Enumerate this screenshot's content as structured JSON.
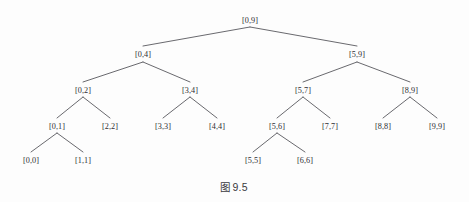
{
  "figure": {
    "caption_prefix": "图",
    "caption_number": "9.5",
    "caption_full": "图 9.5",
    "background_color": "#fdfdfd",
    "line_color": "#58585e",
    "text_color": "#2e2e33"
  },
  "chart_data": {
    "type": "diagram",
    "subtype": "segment-tree",
    "root": "[0,9]",
    "depth": 5,
    "node_count": 19,
    "levels": [
      {
        "level": 0,
        "y": 20,
        "labels": [
          "[0,9]"
        ]
      },
      {
        "level": 1,
        "y": 54,
        "labels": [
          "[0,4]",
          "[5,9]"
        ]
      },
      {
        "level": 2,
        "y": 90,
        "labels": [
          "[0,2]",
          "[3,4]",
          "[5,7]",
          "[8,9]"
        ]
      },
      {
        "level": 3,
        "y": 126,
        "labels": [
          "[0,1]",
          "[2,2]",
          "[3,3]",
          "[4,4]",
          "[5,6]",
          "[7,7]",
          "[8,8]",
          "[9,9]"
        ]
      },
      {
        "level": 4,
        "y": 160,
        "labels": [
          "[0,0]",
          "[1,1]",
          "[5,5]",
          "[6,6]"
        ]
      }
    ],
    "nodes": [
      {
        "id": "n0",
        "label": "[0,9]",
        "x": 250,
        "y": 20,
        "level": 0,
        "parent": null
      },
      {
        "id": "n1",
        "label": "[0,4]",
        "x": 143,
        "y": 54,
        "level": 1,
        "parent": "n0"
      },
      {
        "id": "n2",
        "label": "[5,9]",
        "x": 357,
        "y": 54,
        "level": 1,
        "parent": "n0"
      },
      {
        "id": "n3",
        "label": "[0,2]",
        "x": 83,
        "y": 90,
        "level": 2,
        "parent": "n1"
      },
      {
        "id": "n4",
        "label": "[3,4]",
        "x": 190,
        "y": 90,
        "level": 2,
        "parent": "n1"
      },
      {
        "id": "n5",
        "label": "[5,7]",
        "x": 303,
        "y": 90,
        "level": 2,
        "parent": "n2"
      },
      {
        "id": "n6",
        "label": "[8,9]",
        "x": 410,
        "y": 90,
        "level": 2,
        "parent": "n2"
      },
      {
        "id": "n7",
        "label": "[0,1]",
        "x": 57,
        "y": 126,
        "level": 3,
        "parent": "n3"
      },
      {
        "id": "n8",
        "label": "[2,2]",
        "x": 110,
        "y": 126,
        "level": 3,
        "parent": "n3"
      },
      {
        "id": "n9",
        "label": "[3,3]",
        "x": 163,
        "y": 126,
        "level": 3,
        "parent": "n4"
      },
      {
        "id": "n10",
        "label": "[4,4]",
        "x": 217,
        "y": 126,
        "level": 3,
        "parent": "n4"
      },
      {
        "id": "n11",
        "label": "[5,6]",
        "x": 277,
        "y": 126,
        "level": 3,
        "parent": "n5"
      },
      {
        "id": "n12",
        "label": "[7,7]",
        "x": 330,
        "y": 126,
        "level": 3,
        "parent": "n5"
      },
      {
        "id": "n13",
        "label": "[8,8]",
        "x": 383,
        "y": 126,
        "level": 3,
        "parent": "n6"
      },
      {
        "id": "n14",
        "label": "[9,9]",
        "x": 437,
        "y": 126,
        "level": 3,
        "parent": "n6"
      },
      {
        "id": "n15",
        "label": "[0,0]",
        "x": 31,
        "y": 160,
        "level": 4,
        "parent": "n7"
      },
      {
        "id": "n16",
        "label": "[1,1]",
        "x": 83,
        "y": 160,
        "level": 4,
        "parent": "n7"
      },
      {
        "id": "n17",
        "label": "[5,5]",
        "x": 253,
        "y": 160,
        "level": 4,
        "parent": "n11"
      },
      {
        "id": "n18",
        "label": "[6,6]",
        "x": 305,
        "y": 160,
        "level": 4,
        "parent": "n11"
      }
    ],
    "edges": [
      {
        "from": "n0",
        "to": "n1",
        "x1": 250,
        "y1": 27,
        "x2": 143,
        "y2": 46
      },
      {
        "from": "n0",
        "to": "n2",
        "x1": 250,
        "y1": 27,
        "x2": 357,
        "y2": 46
      },
      {
        "from": "n1",
        "to": "n3",
        "x1": 143,
        "y1": 62,
        "x2": 83,
        "y2": 82
      },
      {
        "from": "n1",
        "to": "n4",
        "x1": 143,
        "y1": 62,
        "x2": 190,
        "y2": 82
      },
      {
        "from": "n2",
        "to": "n5",
        "x1": 357,
        "y1": 62,
        "x2": 303,
        "y2": 82
      },
      {
        "from": "n2",
        "to": "n6",
        "x1": 357,
        "y1": 62,
        "x2": 410,
        "y2": 82
      },
      {
        "from": "n3",
        "to": "n7",
        "x1": 83,
        "y1": 97,
        "x2": 57,
        "y2": 118
      },
      {
        "from": "n3",
        "to": "n8",
        "x1": 83,
        "y1": 97,
        "x2": 110,
        "y2": 118
      },
      {
        "from": "n4",
        "to": "n9",
        "x1": 190,
        "y1": 97,
        "x2": 163,
        "y2": 118
      },
      {
        "from": "n4",
        "to": "n10",
        "x1": 190,
        "y1": 97,
        "x2": 217,
        "y2": 118
      },
      {
        "from": "n5",
        "to": "n11",
        "x1": 303,
        "y1": 97,
        "x2": 277,
        "y2": 118
      },
      {
        "from": "n5",
        "to": "n12",
        "x1": 303,
        "y1": 97,
        "x2": 330,
        "y2": 118
      },
      {
        "from": "n6",
        "to": "n13",
        "x1": 410,
        "y1": 97,
        "x2": 383,
        "y2": 118
      },
      {
        "from": "n6",
        "to": "n14",
        "x1": 410,
        "y1": 97,
        "x2": 437,
        "y2": 118
      },
      {
        "from": "n7",
        "to": "n15",
        "x1": 57,
        "y1": 133,
        "x2": 31,
        "y2": 152
      },
      {
        "from": "n7",
        "to": "n16",
        "x1": 57,
        "y1": 133,
        "x2": 83,
        "y2": 152
      },
      {
        "from": "n11",
        "to": "n17",
        "x1": 277,
        "y1": 133,
        "x2": 253,
        "y2": 152
      },
      {
        "from": "n11",
        "to": "n18",
        "x1": 277,
        "y1": 133,
        "x2": 305,
        "y2": 152
      }
    ]
  }
}
